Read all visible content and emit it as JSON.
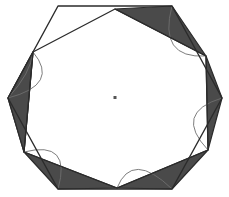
{
  "figure": {
    "type": "geometric-diagram",
    "canvas": {
      "width": 229,
      "height": 197,
      "background": "#ffffff"
    },
    "colors": {
      "blade_fill": "#4a4a4a",
      "outline": "#2b2b2b",
      "arc_stroke": "#6e6e6e",
      "center_dot": "#555555",
      "background": "#ffffff"
    },
    "center": {
      "x": 115,
      "y": 97.5,
      "dot_size": 3
    },
    "outer_hexagon": {
      "name": "outer-hexagon",
      "vertex_count": 6,
      "orientation": "flat-top",
      "rotation_deg": 0,
      "radius_x": 107,
      "radius_y": 91,
      "points": [
        {
          "x": 58,
          "y": 6
        },
        {
          "x": 172,
          "y": 6
        },
        {
          "x": 222,
          "y": 98
        },
        {
          "x": 172,
          "y": 189
        },
        {
          "x": 58,
          "y": 189
        },
        {
          "x": 8,
          "y": 98
        }
      ]
    },
    "inner_hexagon": {
      "name": "inner-hexagon",
      "vertex_count": 6,
      "orientation": "pointy-top",
      "rotation_deg": 22,
      "radius_x": 99,
      "radius_y": 89,
      "points": [
        {
          "x": 115,
          "y": 9
        },
        {
          "x": 206,
          "y": 56
        },
        {
          "x": 208,
          "y": 150
        },
        {
          "x": 117,
          "y": 188
        },
        {
          "x": 24,
          "y": 152
        },
        {
          "x": 33,
          "y": 52
        }
      ]
    },
    "blades": [
      {
        "name": "blade-top-left",
        "index": 0,
        "has_arc": true
      },
      {
        "name": "blade-top-right",
        "index": 1,
        "has_arc": true
      },
      {
        "name": "blade-right",
        "index": 2,
        "has_arc": true
      },
      {
        "name": "blade-bottom-right",
        "index": 3,
        "has_arc": true
      },
      {
        "name": "blade-bottom-left",
        "index": 4,
        "has_arc": true
      },
      {
        "name": "blade-left",
        "index": 5,
        "has_arc": true
      }
    ],
    "blade_count": 6,
    "arc_count": 6
  }
}
